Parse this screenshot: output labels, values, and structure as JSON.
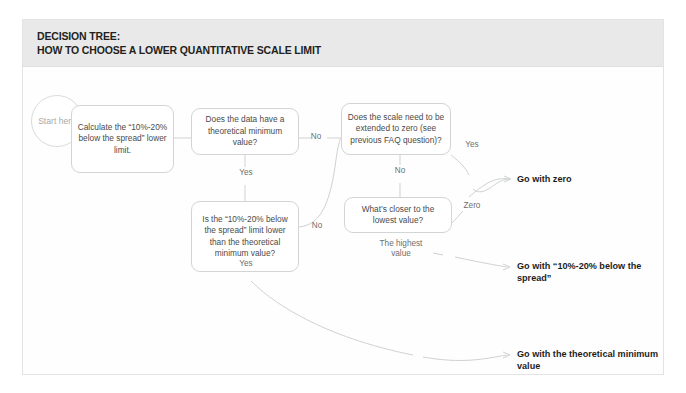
{
  "header": {
    "title_line1": "DECISION TREE:",
    "title_line2": "HOW TO CHOOSE A LOWER QUANTITATIVE SCALE LIMIT",
    "band_color": "#e9e9e9"
  },
  "colors": {
    "node_border": "#d2d4d6",
    "node_text": "#4a4a4a",
    "edge_label_text": "#6e6e6e",
    "outcome_text": "#1d1d1d",
    "start_text": "#a9aaac",
    "wire": "#cfd1d3"
  },
  "start": {
    "label": "Start\nhere"
  },
  "nodes": [
    {
      "id": "calculate",
      "text": "Calculate the\n“10%-20% below\nthe spread”\nlower limit."
    },
    {
      "id": "theoretical-min",
      "text": "Does the data have\na theoretical\nminimum value?"
    },
    {
      "id": "extend-to-zero",
      "text": "Does the scale need\nto be extended to\nzero (see previous\nFAQ question)?"
    },
    {
      "id": "limit-lower",
      "text": "Is the “10%-20%\nbelow the spread”\nlimit lower than the\ntheoretical\nminimum value?"
    },
    {
      "id": "closer-lowest",
      "text": "What’s closer to the\nlowest value?"
    }
  ],
  "edge_labels": [
    {
      "id": "theoretical-min-no",
      "text": "No"
    },
    {
      "id": "theoretical-min-yes",
      "text": "Yes"
    },
    {
      "id": "extend-to-zero-yes",
      "text": "Yes"
    },
    {
      "id": "extend-to-zero-no",
      "text": "No"
    },
    {
      "id": "limit-lower-no",
      "text": "No"
    },
    {
      "id": "limit-lower-yes",
      "text": "Yes"
    },
    {
      "id": "closer-lowest-zero",
      "text": "Zero"
    },
    {
      "id": "closer-lowest-highest",
      "text": "The highest\nvalue"
    }
  ],
  "outcomes": [
    {
      "id": "go-zero",
      "text": "Go with zero"
    },
    {
      "id": "go-spread",
      "text": "Go with “10%-20%\nbelow the spread”"
    },
    {
      "id": "go-theoretical",
      "text": "Go with the theoretical\nminimum value"
    }
  ]
}
